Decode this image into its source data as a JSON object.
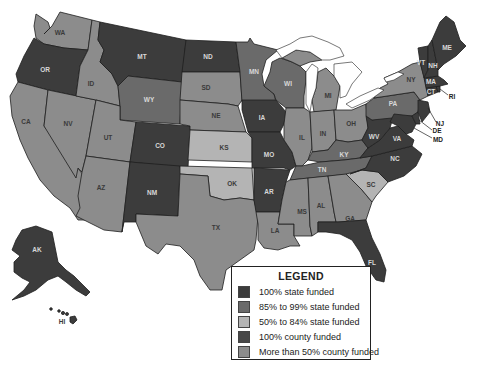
{
  "colors": {
    "state_100": "#3c3c3c",
    "state_85_99": "#6a6a6a",
    "state_50_84": "#b4b4b4",
    "county_100": "#484848",
    "county_50_plus": "#8c8c8c",
    "water": "#ffffff",
    "background": "#ffffff"
  },
  "legend": {
    "title": "LEGEND",
    "items": [
      {
        "key": "state_100",
        "label": "100% state funded"
      },
      {
        "key": "state_85_99",
        "label": "85% to 99% state funded"
      },
      {
        "key": "state_50_84",
        "label": "50% to 84% state funded"
      },
      {
        "key": "county_100",
        "label": "100% county funded"
      },
      {
        "key": "county_50_plus",
        "label": "More than 50% county funded"
      }
    ]
  },
  "states": {
    "WA": {
      "label": "WA",
      "category": "county_50_plus"
    },
    "OR": {
      "label": "OR",
      "category": "state_100"
    },
    "CA": {
      "label": "CA",
      "category": "county_50_plus"
    },
    "NV": {
      "label": "NV",
      "category": "county_50_plus"
    },
    "ID": {
      "label": "ID",
      "category": "county_50_plus"
    },
    "MT": {
      "label": "MT",
      "category": "state_100"
    },
    "WY": {
      "label": "WY",
      "category": "state_85_99"
    },
    "UT": {
      "label": "UT",
      "category": "county_50_plus"
    },
    "AZ": {
      "label": "AZ",
      "category": "county_50_plus"
    },
    "CO": {
      "label": "CO",
      "category": "state_100"
    },
    "NM": {
      "label": "NM",
      "category": "state_100"
    },
    "ND": {
      "label": "ND",
      "category": "state_100"
    },
    "SD": {
      "label": "SD",
      "category": "county_50_plus"
    },
    "NE": {
      "label": "NE",
      "category": "county_50_plus"
    },
    "KS": {
      "label": "KS",
      "category": "state_50_84"
    },
    "OK": {
      "label": "OK",
      "category": "state_50_84"
    },
    "TX": {
      "label": "TX",
      "category": "county_50_plus"
    },
    "MN": {
      "label": "MN",
      "category": "state_85_99"
    },
    "IA": {
      "label": "IA",
      "category": "state_100"
    },
    "MO": {
      "label": "MO",
      "category": "state_100"
    },
    "AR": {
      "label": "AR",
      "category": "state_100"
    },
    "LA": {
      "label": "LA",
      "category": "county_50_plus"
    },
    "WI": {
      "label": "WI",
      "category": "state_85_99"
    },
    "IL": {
      "label": "IL",
      "category": "county_50_plus"
    },
    "MI": {
      "label": "MI",
      "category": "county_50_plus"
    },
    "IN": {
      "label": "IN",
      "category": "county_50_plus"
    },
    "OH": {
      "label": "OH",
      "category": "county_50_plus"
    },
    "KY": {
      "label": "KY",
      "category": "state_85_99"
    },
    "TN": {
      "label": "TN",
      "category": "state_85_99"
    },
    "MS": {
      "label": "MS",
      "category": "county_50_plus"
    },
    "AL": {
      "label": "AL",
      "category": "county_50_plus"
    },
    "GA": {
      "label": "GA",
      "category": "county_50_plus"
    },
    "FL": {
      "label": "FL",
      "category": "state_100"
    },
    "SC": {
      "label": "SC",
      "category": "state_50_84"
    },
    "NC": {
      "label": "NC",
      "category": "state_100"
    },
    "VA": {
      "label": "VA",
      "category": "state_100"
    },
    "WV": {
      "label": "WV",
      "category": "state_100"
    },
    "PA": {
      "label": "PA",
      "category": "state_85_99"
    },
    "NY": {
      "label": "NY",
      "category": "county_50_plus"
    },
    "VT": {
      "label": "VT",
      "category": "state_100"
    },
    "NH": {
      "label": "NH",
      "category": "state_100"
    },
    "ME": {
      "label": "ME",
      "category": "state_100"
    },
    "MA": {
      "label": "MA",
      "category": "state_100"
    },
    "CT": {
      "label": "CT",
      "category": "state_100"
    },
    "RI": {
      "label": "RI",
      "category": "state_100"
    },
    "NJ": {
      "label": "NJ",
      "category": "state_100"
    },
    "DE": {
      "label": "DE",
      "category": "state_100"
    },
    "MD": {
      "label": "MD",
      "category": "state_100"
    },
    "AK": {
      "label": "AK",
      "category": "state_100"
    },
    "HI": {
      "label": "HI",
      "category": "state_100"
    }
  }
}
